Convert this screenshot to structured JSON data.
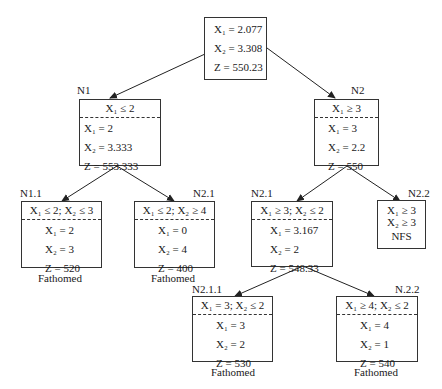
{
  "root": {
    "label": "",
    "rows": [
      "X₁ = 2.077",
      "X₂ = 3.308",
      "Z  = 550.23"
    ]
  },
  "n1": {
    "label": "N1",
    "constraint": "X₁ ≤ 2",
    "rows": [
      "X₁ = 2",
      "X₂ = 3.333",
      "Z  = 553.333"
    ]
  },
  "n2": {
    "label": "N2",
    "constraint": "X₁ ≥ 3",
    "rows": [
      "X₁ = 3",
      "X₂ = 2.2",
      "Z  = 550"
    ]
  },
  "n11": {
    "label": "N1.1",
    "constraint": "X₁ ≤ 2; X₂ ≤ 3",
    "rows": [
      "X₁ = 2",
      "X₂ = 3",
      "Z  = 520"
    ],
    "status": "Fathomed"
  },
  "n21a": {
    "label": "N2.1",
    "constraint": "X₁ ≤ 2; X₂ ≥ 4",
    "rows": [
      "X₁ = 0",
      "X₂ = 4",
      "Z  = 400"
    ],
    "status": "Fathomed"
  },
  "n21b": {
    "label": "N2.1",
    "constraint": "X₁ ≥ 3; X₂ ≤ 2",
    "rows": [
      "X₁ = 3.167",
      "X₂ = 2",
      "Z  = 548.33"
    ]
  },
  "n22": {
    "label": "N2.2",
    "rows": [
      "X₁ ≥ 3",
      "X₂ ≥ 3"
    ],
    "status": "NFS"
  },
  "n211": {
    "label": "N2.1.1",
    "constraint": "X₁ = 3; X₂ ≤ 2",
    "rows": [
      "X₁ = 3",
      "X₂ = 2",
      "Z  = 530"
    ],
    "status": "Fathomed"
  },
  "n212": {
    "label": "N.2.2",
    "constraint": "X₁ ≥ 4; X₂ ≤ 2",
    "rows": [
      "X₁ = 4",
      "X₂ = 1",
      "Z  = 540"
    ],
    "status": "Fathomed"
  }
}
